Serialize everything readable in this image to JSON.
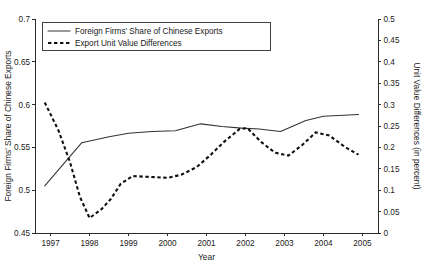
{
  "chart_data": {
    "type": "line",
    "title": "",
    "xlabel": "Year",
    "ylabel": "Foreign Firms' Share of Chinese Exports",
    "y2label": "Unit Value Differences (in percent)",
    "x": [
      1997,
      1998,
      1999,
      2000,
      2001,
      2002,
      2003,
      2004,
      2005
    ],
    "xlim": [
      1996.6,
      2005.4
    ],
    "ylim": [
      0.45,
      0.7
    ],
    "y2lim": [
      0,
      0.5
    ],
    "grid": false,
    "legend_position": "top-left",
    "xticklabels": [
      "1997",
      "1998",
      "1999",
      "2000",
      "2001",
      "2002",
      "2003",
      "2004",
      "2005"
    ],
    "yticklabels": [
      "0.45",
      "0.5",
      "0.55",
      "0.6",
      "0.65",
      "0.7"
    ],
    "yticks": [
      0.45,
      0.5,
      0.55,
      0.6,
      0.65,
      0.7
    ],
    "y2ticklabels": [
      "0",
      "0.05",
      "0.1",
      "0.15",
      "0.2",
      "0.25",
      "0.3",
      "0.35",
      "0.4",
      "0.45",
      "0.5"
    ],
    "y2ticks": [
      0,
      0.05,
      0.1,
      0.15,
      0.2,
      0.25,
      0.3,
      0.35,
      0.4,
      0.45,
      0.5
    ],
    "series": [
      {
        "name": "Foreign Firms' Share of Chinese Exports",
        "axis": "left",
        "style": "solid",
        "x": [
          1996.85,
          1997.8,
          1998.5,
          1999.0,
          1999.6,
          2000.2,
          2000.85,
          2001.4,
          2001.9,
          2002.35,
          2002.9,
          2003.55,
          2004.0,
          2004.9
        ],
        "values": [
          0.505,
          0.5555,
          0.5625,
          0.5665,
          0.5685,
          0.5695,
          0.5775,
          0.5745,
          0.5725,
          0.5715,
          0.5685,
          0.5815,
          0.5865,
          0.5885
        ]
      },
      {
        "name": "Export Unit Value Differences",
        "axis": "right",
        "style": "dashed",
        "x": [
          1996.85,
          1997.2,
          1997.5,
          1997.75,
          1998.0,
          1998.3,
          1998.55,
          1998.8,
          1999.1,
          1999.55,
          2000.0,
          2000.35,
          2000.75,
          2001.1,
          2001.45,
          2001.85,
          2002.05,
          2002.4,
          2002.75,
          2003.1,
          2003.45,
          2003.8,
          2004.15,
          2004.55,
          2004.9
        ],
        "values": [
          0.305,
          0.24,
          0.165,
          0.085,
          0.035,
          0.055,
          0.08,
          0.115,
          0.133,
          0.131,
          0.129,
          0.136,
          0.154,
          0.182,
          0.213,
          0.243,
          0.245,
          0.213,
          0.188,
          0.181,
          0.205,
          0.235,
          0.228,
          0.201,
          0.183
        ]
      }
    ],
    "legend": [
      {
        "label": "Foreign Firms' Share of Chinese Exports",
        "style": "solid"
      },
      {
        "label": "Export Unit Value Differences",
        "style": "dashed"
      }
    ]
  }
}
